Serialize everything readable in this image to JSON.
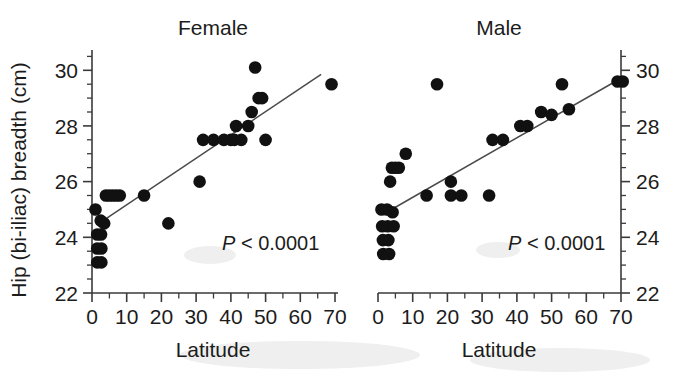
{
  "figure": {
    "background_color": "#ffffff",
    "ink_color": "#111111"
  },
  "chart_data": [
    {
      "type": "scatter",
      "title": "Female",
      "xlabel": "Latitude",
      "ylabel": "Hip (bi-iliac) breadth (cm)",
      "xlim": [
        0,
        72
      ],
      "ylim": [
        22,
        31
      ],
      "xticks": [
        0,
        10,
        20,
        30,
        40,
        50,
        60,
        70
      ],
      "xtick_labels": [
        "0",
        "10",
        "20",
        "30",
        "40",
        "50",
        "60",
        "70"
      ],
      "yticks": [
        22,
        24,
        26,
        28,
        30
      ],
      "ytick_labels": [
        "22",
        "24",
        "26",
        "28",
        "30"
      ],
      "minor_tick_step_x": 5,
      "minor_tick_step_y": 0.5,
      "grid": false,
      "legend": "none",
      "annotation": "P < 0.0001",
      "annotation_prefix": "P",
      "annotation_suffix": " < 0.0001",
      "yaxis_position": "left",
      "points": [
        [
          1.0,
          25.0
        ],
        [
          1.5,
          24.1
        ],
        [
          1.5,
          23.6
        ],
        [
          1.5,
          23.1
        ],
        [
          2.5,
          24.6
        ],
        [
          2.6,
          24.1
        ],
        [
          2.7,
          23.6
        ],
        [
          2.7,
          23.1
        ],
        [
          3.5,
          24.5
        ],
        [
          4.0,
          25.5
        ],
        [
          5.0,
          25.5
        ],
        [
          6.0,
          25.5
        ],
        [
          7.0,
          25.5
        ],
        [
          8.0,
          25.5
        ],
        [
          15.0,
          25.5
        ],
        [
          22.0,
          24.5
        ],
        [
          31.0,
          26.0
        ],
        [
          32.0,
          27.5
        ],
        [
          35.0,
          27.5
        ],
        [
          38.0,
          27.5
        ],
        [
          40.0,
          27.5
        ],
        [
          41.0,
          27.5
        ],
        [
          41.5,
          28.0
        ],
        [
          43.0,
          27.5
        ],
        [
          45.0,
          28.0
        ],
        [
          46.0,
          28.5
        ],
        [
          47.0,
          30.1
        ],
        [
          48.0,
          29.0
        ],
        [
          49.0,
          29.0
        ],
        [
          50.0,
          27.5
        ],
        [
          69.0,
          29.5
        ]
      ],
      "fit_line": {
        "x0": 3.2,
        "y0": 24.6,
        "x1": 66.0,
        "y1": 29.85
      }
    },
    {
      "type": "scatter",
      "title": "Male",
      "xlabel": "Latitude",
      "ylabel": "",
      "xlim": [
        0,
        72
      ],
      "ylim": [
        22,
        31
      ],
      "xticks": [
        0,
        10,
        20,
        30,
        40,
        50,
        60,
        70
      ],
      "xtick_labels": [
        "0",
        "10",
        "20",
        "30",
        "40",
        "50",
        "60",
        "70"
      ],
      "yticks": [
        22,
        24,
        26,
        28,
        30
      ],
      "ytick_labels": [
        "22",
        "24",
        "26",
        "28",
        "30"
      ],
      "minor_tick_step_x": 5,
      "minor_tick_step_y": 0.5,
      "grid": false,
      "legend": "none",
      "annotation": "P < 0.0001",
      "annotation_prefix": "P",
      "annotation_suffix": " < 0.0001",
      "yaxis_position": "right",
      "points": [
        [
          1.0,
          25.0
        ],
        [
          1.2,
          24.4
        ],
        [
          1.4,
          23.9
        ],
        [
          1.5,
          23.4
        ],
        [
          2.6,
          25.0
        ],
        [
          2.8,
          24.4
        ],
        [
          3.0,
          23.9
        ],
        [
          3.2,
          23.4
        ],
        [
          4.2,
          24.9
        ],
        [
          4.5,
          24.4
        ],
        [
          4.0,
          26.5
        ],
        [
          5.0,
          26.5
        ],
        [
          6.0,
          26.5
        ],
        [
          3.5,
          26.0
        ],
        [
          8.0,
          27.0
        ],
        [
          14.0,
          25.5
        ],
        [
          17.0,
          29.5
        ],
        [
          21.0,
          26.0
        ],
        [
          21.0,
          25.5
        ],
        [
          24.0,
          25.5
        ],
        [
          32.0,
          25.5
        ],
        [
          33.0,
          27.5
        ],
        [
          36.0,
          27.5
        ],
        [
          41.0,
          28.0
        ],
        [
          43.0,
          28.0
        ],
        [
          47.0,
          28.5
        ],
        [
          50.0,
          28.4
        ],
        [
          53.0,
          29.5
        ],
        [
          55.0,
          28.6
        ],
        [
          69.0,
          29.6
        ],
        [
          70.5,
          29.6
        ]
      ],
      "fit_line": {
        "x0": 2.5,
        "y0": 24.9,
        "x1": 70.5,
        "y1": 29.75
      }
    }
  ],
  "axes": {
    "left_panel": {
      "title": "Female",
      "xlabel": "Latitude",
      "ylabel": "Hip (bi-iliac) breadth (cm)",
      "pvalue_italic": "P",
      "pvalue_rest": " < 0.0001"
    },
    "right_panel": {
      "title": "Male",
      "xlabel": "Latitude",
      "pvalue_italic": "P",
      "pvalue_rest": " < 0.0001"
    }
  },
  "tick_labels": {
    "x": [
      "0",
      "10",
      "20",
      "30",
      "40",
      "50",
      "60",
      "70"
    ],
    "y": [
      "22",
      "24",
      "26",
      "28",
      "30"
    ]
  }
}
